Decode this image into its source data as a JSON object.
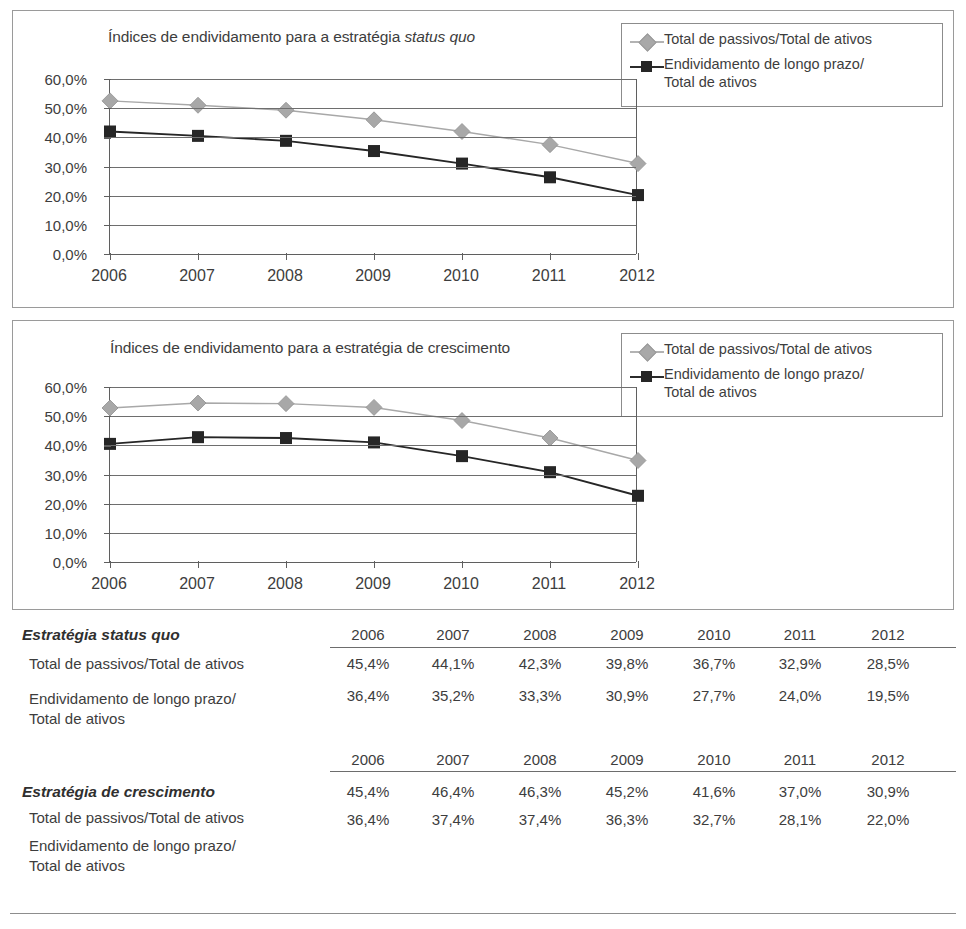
{
  "figure": {
    "charts": [
      {
        "id": "status-quo",
        "title_main": "Índices de endividamento para a estratégia ",
        "title_italic": "status quo",
        "legend": [
          {
            "marker": "diamond-gray-icon",
            "color": "#a8a8a8",
            "label": "Total de passivos/Total de ativos"
          },
          {
            "marker": "square-black-icon",
            "color": "#262626",
            "label": "Endividamento de longo prazo/\nTotal de ativos"
          }
        ],
        "y_ticks": [
          "0,0%",
          "10,0%",
          "20,0%",
          "30,0%",
          "40,0%",
          "50,0%",
          "60,0%"
        ],
        "x_ticks": [
          "2006",
          "2007",
          "2008",
          "2009",
          "2010",
          "2011",
          "2012"
        ]
      },
      {
        "id": "crescimento",
        "title_main": "Índices de endividamento para a estratégia de crescimento",
        "title_italic": "",
        "legend": [
          {
            "marker": "diamond-gray-icon",
            "color": "#a8a8a8",
            "label": "Total de passivos/Total de ativos"
          },
          {
            "marker": "square-black-icon",
            "color": "#262626",
            "label": "Endividamento de longo prazo/\nTotal de ativos"
          }
        ],
        "y_ticks": [
          "0,0%",
          "10,0%",
          "20,0%",
          "30,0%",
          "40,0%",
          "50,0%",
          "60,0%"
        ],
        "x_ticks": [
          "2006",
          "2007",
          "2008",
          "2009",
          "2010",
          "2011",
          "2012"
        ]
      }
    ],
    "tables": [
      {
        "id": "tabela-status-quo",
        "title": "Estratégia status quo",
        "years": [
          "2006",
          "2007",
          "2008",
          "2009",
          "2010",
          "2011",
          "2012"
        ],
        "rows": [
          {
            "label": "Total de passivos/Total de ativos",
            "values": [
              "45,4%",
              "44,1%",
              "42,3%",
              "39,8%",
              "36,7%",
              "32,9%",
              "28,5%"
            ]
          },
          {
            "label": "Endividamento de longo prazo/\nTotal de ativos",
            "values": [
              "36,4%",
              "35,2%",
              "33,3%",
              "30,9%",
              "27,7%",
              "24,0%",
              "19,5%"
            ]
          }
        ]
      },
      {
        "id": "tabela-crescimento",
        "title": "Estratégia de crescimento",
        "years": [
          "2006",
          "2007",
          "2008",
          "2009",
          "2010",
          "2011",
          "2012"
        ],
        "rows": [
          {
            "label": "Total de passivos/Total de ativos",
            "values": [
              "45,4%",
              "46,4%",
              "46,3%",
              "45,2%",
              "41,6%",
              "37,0%",
              "30,9%"
            ]
          },
          {
            "label": "Endividamento de longo prazo/\nTotal de ativos",
            "values": [
              "36,4%",
              "37,4%",
              "37,4%",
              "36,3%",
              "32,7%",
              "28,1%",
              "22,0%"
            ]
          }
        ]
      }
    ]
  },
  "chart_data": [
    {
      "type": "line",
      "title": "Índices de endividamento para a estratégia status quo",
      "xlabel": "",
      "ylabel": "",
      "categories": [
        "2006",
        "2007",
        "2008",
        "2009",
        "2010",
        "2011",
        "2012"
      ],
      "ylim": [
        0,
        60
      ],
      "yticks": [
        0,
        10,
        20,
        30,
        40,
        50,
        60
      ],
      "ytick_labels": [
        "0,0%",
        "10,0%",
        "20,0%",
        "30,0%",
        "40,0%",
        "50,0%",
        "60,0%"
      ],
      "grid": true,
      "legend_position": "top-right-outside",
      "series": [
        {
          "name": "Total de passivos/Total de ativos",
          "color": "#a8a8a8",
          "marker": "diamond",
          "values": [
            52.5,
            51.0,
            49.3,
            46.0,
            42.0,
            37.5,
            31.0
          ]
        },
        {
          "name": "Endividamento de longo prazo/Total de ativos",
          "color": "#262626",
          "marker": "square",
          "values": [
            42.0,
            40.5,
            38.8,
            35.3,
            31.0,
            26.3,
            20.2
          ]
        }
      ]
    },
    {
      "type": "line",
      "title": "Índices de endividamento para a estratégia de crescimento",
      "xlabel": "",
      "ylabel": "",
      "categories": [
        "2006",
        "2007",
        "2008",
        "2009",
        "2010",
        "2011",
        "2012"
      ],
      "ylim": [
        0,
        60
      ],
      "yticks": [
        0,
        10,
        20,
        30,
        40,
        50,
        60
      ],
      "ytick_labels": [
        "0,0%",
        "10,0%",
        "20,0%",
        "30,0%",
        "40,0%",
        "50,0%",
        "60,0%"
      ],
      "grid": true,
      "legend_position": "top-right-outside",
      "series": [
        {
          "name": "Total de passivos/Total de ativos",
          "color": "#a8a8a8",
          "marker": "diamond",
          "values": [
            52.8,
            54.5,
            54.3,
            53.0,
            48.5,
            42.5,
            34.8
          ]
        },
        {
          "name": "Endividamento de longo prazo/Total de ativos",
          "color": "#262626",
          "marker": "square",
          "values": [
            40.5,
            42.8,
            42.5,
            41.0,
            36.3,
            30.8,
            22.7
          ]
        }
      ]
    },
    {
      "type": "table",
      "title": "Estratégia status quo",
      "columns": [
        "2006",
        "2007",
        "2008",
        "2009",
        "2010",
        "2011",
        "2012"
      ],
      "rows": [
        {
          "label": "Total de passivos/Total de ativos",
          "values": [
            "45,4%",
            "44,1%",
            "42,3%",
            "39,8%",
            "36,7%",
            "32,9%",
            "28,5%"
          ]
        },
        {
          "label": "Endividamento de longo prazo/Total de ativos",
          "values": [
            "36,4%",
            "35,2%",
            "33,3%",
            "30,9%",
            "27,7%",
            "24,0%",
            "19,5%"
          ]
        }
      ]
    },
    {
      "type": "table",
      "title": "Estratégia de crescimento",
      "columns": [
        "2006",
        "2007",
        "2008",
        "2009",
        "2010",
        "2011",
        "2012"
      ],
      "rows": [
        {
          "label": "Total de passivos/Total de ativos",
          "values": [
            "45,4%",
            "46,4%",
            "46,3%",
            "45,2%",
            "41,6%",
            "37,0%",
            "30,9%"
          ]
        },
        {
          "label": "Endividamento de longo prazo/Total de ativos",
          "values": [
            "36,4%",
            "37,4%",
            "37,4%",
            "36,3%",
            "32,7%",
            "28,1%",
            "22,0%"
          ]
        }
      ]
    }
  ]
}
